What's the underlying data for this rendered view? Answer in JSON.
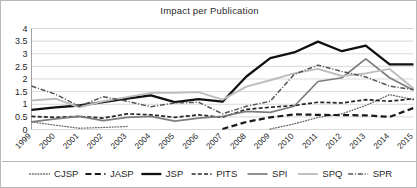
{
  "chart_data": {
    "type": "line",
    "title": "Impact per Publication",
    "xlabel": "",
    "ylabel": "",
    "ylim": [
      0,
      4
    ],
    "ytick_step": 0.5,
    "yticks": [
      "0",
      "0.5",
      "1",
      "1.5",
      "2",
      "2.5",
      "3",
      "3.5",
      "4"
    ],
    "grid": true,
    "legend_position": "bottom",
    "categories": [
      "1999",
      "2000",
      "2001",
      "2002",
      "2003",
      "2004",
      "2005",
      "2006",
      "2007",
      "2008",
      "2009",
      "2010",
      "2011",
      "2012",
      "2013",
      "2014",
      "2015"
    ],
    "series": [
      {
        "name": "CJSP",
        "style": "dotted",
        "color": "#6b6b6b",
        "values": [
          0.3,
          0.17,
          0.05,
          0.08,
          0.12,
          null,
          null,
          null,
          null,
          null,
          0.02,
          0.22,
          0.48,
          0.62,
          0.95,
          1.38,
          1.18
        ]
      },
      {
        "name": "JASP",
        "style": "dashed-thick",
        "color": "#1a1a1a",
        "values": [
          null,
          null,
          null,
          null,
          null,
          null,
          null,
          null,
          0.02,
          0.3,
          0.48,
          0.6,
          0.58,
          0.57,
          0.56,
          0.5,
          0.85
        ]
      },
      {
        "name": "JSP",
        "style": "solid-thick",
        "color": "#111111",
        "values": [
          0.78,
          0.88,
          0.95,
          1.08,
          1.22,
          1.35,
          1.08,
          1.2,
          1.1,
          2.1,
          2.83,
          3.05,
          3.48,
          3.1,
          3.32,
          2.58,
          2.58
        ]
      },
      {
        "name": "PITS",
        "style": "dashed-medium",
        "color": "#262626",
        "values": [
          0.52,
          0.48,
          0.52,
          0.45,
          0.62,
          0.58,
          0.48,
          0.58,
          0.48,
          0.8,
          0.88,
          0.95,
          1.08,
          1.05,
          1.18,
          1.12,
          1.22
        ]
      },
      {
        "name": "SPI",
        "style": "solid-gray",
        "color": "#7d7d7d",
        "values": [
          0.3,
          0.42,
          0.52,
          0.35,
          0.48,
          0.52,
          0.33,
          0.45,
          0.52,
          0.72,
          0.68,
          0.92,
          1.9,
          2.05,
          2.8,
          2.05,
          1.55
        ]
      },
      {
        "name": "SPQ",
        "style": "solid-lightgray",
        "color": "#bdbdbd",
        "values": [
          1.15,
          1.22,
          0.88,
          1.12,
          1.28,
          1.45,
          1.45,
          1.48,
          1.18,
          1.7,
          1.95,
          2.22,
          2.4,
          2.12,
          2.22,
          2.4,
          1.62
        ]
      },
      {
        "name": "SPR",
        "style": "dash-dot",
        "color": "#555555",
        "values": [
          1.72,
          1.4,
          0.92,
          1.3,
          1.12,
          0.9,
          1.05,
          1.08,
          0.62,
          0.92,
          1.12,
          2.18,
          2.55,
          2.3,
          2.08,
          1.72,
          1.58
        ]
      }
    ]
  }
}
